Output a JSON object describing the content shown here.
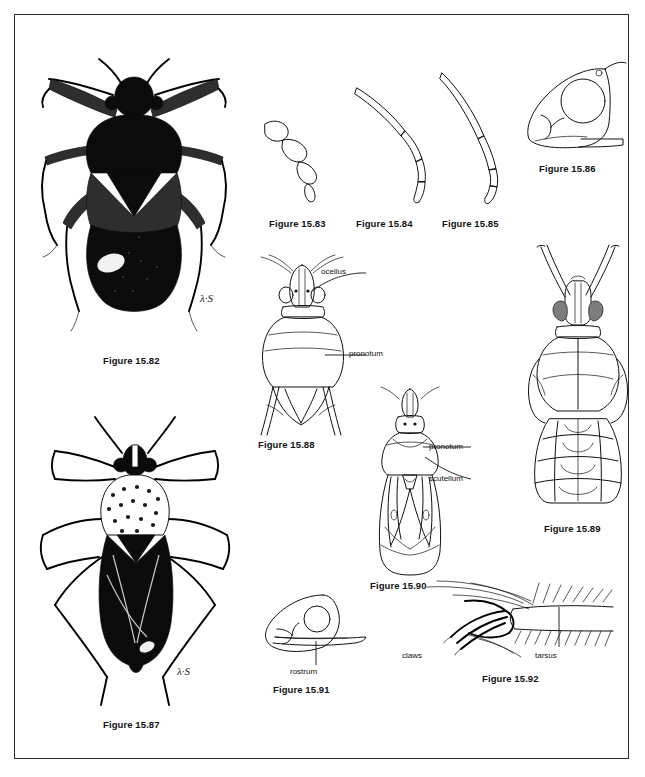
{
  "plate": {
    "background_color": "#ffffff",
    "border_color": "#2b2b2b",
    "ink_color": "#111111",
    "signature": "λ·S"
  },
  "figures": [
    {
      "id": "15.82",
      "caption": "Figure 15.82",
      "subject": "adult-bug-dorsal-habitus",
      "description": "Dark stout broad-shouldered bug, dorsal view, heavily stippled",
      "annotations": [],
      "signature": "λ·S"
    },
    {
      "id": "15.83",
      "caption": "Figure 15.83",
      "subject": "antenna-moniliform",
      "description": "Antenna with short thick beaded segments",
      "annotations": []
    },
    {
      "id": "15.84",
      "caption": "Figure 15.84",
      "subject": "antenna-filiform-medium",
      "description": "Antenna with long slender segments",
      "annotations": []
    },
    {
      "id": "15.85",
      "caption": "Figure 15.85",
      "subject": "antenna-filiform-long",
      "description": "Antenna with very long slender first segment",
      "annotations": []
    },
    {
      "id": "15.86",
      "caption": "Figure 15.86",
      "subject": "head-lateral-large-eye",
      "description": "Head in lateral view with large rounded eye and ocellus",
      "annotations": []
    },
    {
      "id": "15.87",
      "caption": "Figure 15.87",
      "subject": "adult-bug-dorsal-habitus-long-legs",
      "description": "Slender long-legged bug, dorsal view, mottled pronotum",
      "annotations": [],
      "signature": "λ·S"
    },
    {
      "id": "15.88",
      "caption": "Figure 15.88",
      "subject": "head-and-pronotum-dorsal",
      "description": "Head and pronotum dorsal view with ocelli and legs",
      "annotations": [
        {
          "text": "ocellus",
          "name": "ocellus"
        },
        {
          "text": "pronotum",
          "name": "pronotum"
        }
      ]
    },
    {
      "id": "15.89",
      "caption": "Figure 15.89",
      "subject": "nymph-dorsal",
      "description": "Nymph dorsal view with segmented abdomen and stippled eyes",
      "annotations": []
    },
    {
      "id": "15.90",
      "caption": "Figure 15.90",
      "subject": "body-dorsal-with-wings",
      "description": "Narrow elongate bug dorsal view showing pronotum, scutellum and hemelytra",
      "annotations": [
        {
          "text": "pronotum",
          "name": "pronotum"
        },
        {
          "text": "scutellum",
          "name": "scutellum"
        }
      ]
    },
    {
      "id": "15.91",
      "caption": "Figure 15.91",
      "subject": "head-lateral-with-rostrum",
      "description": "Head in lateral view with long rostrum beneath",
      "annotations": [
        {
          "text": "rostrum",
          "name": "rostrum"
        }
      ]
    },
    {
      "id": "15.92",
      "caption": "Figure 15.92",
      "subject": "tarsus-and-claws",
      "description": "Tip of leg showing hairy tarsus and curved claws",
      "annotations": [
        {
          "text": "claws",
          "name": "claws"
        },
        {
          "text": "tarsus",
          "name": "tarsus"
        }
      ]
    }
  ]
}
